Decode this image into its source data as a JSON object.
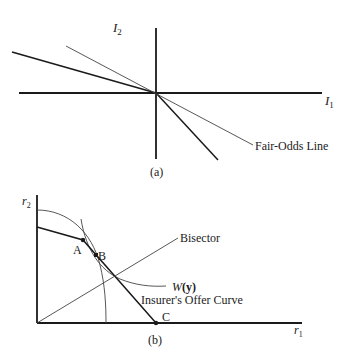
{
  "figure_a": {
    "y_axis_label": "I",
    "y_axis_sub": "2",
    "x_axis_label": "I",
    "x_axis_sub": "1",
    "fair_odds_label": "Fair-Odds Line",
    "caption": "(a)"
  },
  "figure_b": {
    "y_axis_label": "r",
    "y_axis_sub": "2",
    "x_axis_label": "r",
    "x_axis_sub": "1",
    "bisector_label": "Bisector",
    "w_label_italic": "W",
    "w_label_arg": "(y)",
    "offer_curve_label": "Insurer's Offer Curve",
    "point_a": "A",
    "point_b": "B",
    "point_c": "C",
    "caption": "(b)"
  },
  "colors": {
    "line": "#1a1a1a",
    "thin_line": "#444444",
    "background": "#ffffff"
  }
}
